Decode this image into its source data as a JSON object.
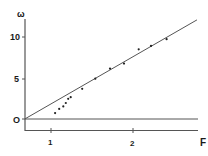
{
  "chart_data": {
    "type": "scatter",
    "title": "",
    "ylabel": "ω",
    "xlabel": "F",
    "x_ticks": [
      {
        "value": 1,
        "label": "1"
      },
      {
        "value": 2,
        "label": "2"
      }
    ],
    "y_ticks": [
      {
        "value": 0,
        "label": "O"
      },
      {
        "value": 5,
        "label": "5"
      },
      {
        "value": 10,
        "label": "10"
      }
    ],
    "xlim": [
      0.68,
      2.82
    ],
    "ylim": [
      -1.4,
      12.0
    ],
    "grid": false,
    "legend": null,
    "horizontal_reference_line": {
      "y": 0
    },
    "fit_line": {
      "x0": 0.68,
      "y0": 0.0,
      "x1": 2.78,
      "y1": 11.8
    },
    "points": [
      {
        "x": 1.05,
        "y": 0.7
      },
      {
        "x": 1.1,
        "y": 1.2
      },
      {
        "x": 1.15,
        "y": 1.5
      },
      {
        "x": 1.18,
        "y": 1.9
      },
      {
        "x": 1.21,
        "y": 2.4
      },
      {
        "x": 1.24,
        "y": 2.6
      },
      {
        "x": 1.38,
        "y": 3.6
      },
      {
        "x": 1.54,
        "y": 4.8
      },
      {
        "x": 1.72,
        "y": 6.0
      },
      {
        "x": 1.89,
        "y": 6.6
      },
      {
        "x": 2.07,
        "y": 8.3
      },
      {
        "x": 2.22,
        "y": 8.7
      },
      {
        "x": 2.41,
        "y": 9.5
      }
    ]
  },
  "labels": {
    "y_axis": "ω",
    "x_axis": "F",
    "tick_10": "10",
    "tick_5": "5",
    "tick_0": "O",
    "tick_x1": "1",
    "tick_x2": "2"
  }
}
